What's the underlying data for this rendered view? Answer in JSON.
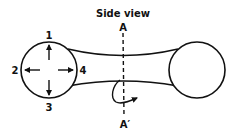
{
  "diagram": {
    "title": "Side view",
    "section_labels": {
      "top": "A",
      "bottom": "A′"
    },
    "direction_labels": [
      "1",
      "2",
      "3",
      "4"
    ],
    "shapes": {
      "left_circle": "left-lobe",
      "right_circle": "right-lobe",
      "connector": "neck",
      "section_line": "dashed-cut-line",
      "rotation_arrow": "curved-arrow"
    }
  }
}
